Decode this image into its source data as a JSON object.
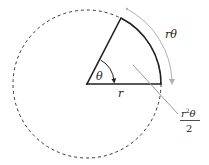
{
  "diagram": {
    "labels": {
      "radius": "r",
      "angle": "θ",
      "arc_length": "rθ",
      "area_numerator_base": "r",
      "area_numerator_sup": "2",
      "area_numerator_tail": "θ",
      "area_denominator": "2"
    },
    "colors": {
      "sector_stroke": "#222222",
      "circle_dash": "#333333",
      "annotation_gray": "#b0b0b0",
      "leader_gray": "#999999"
    }
  }
}
